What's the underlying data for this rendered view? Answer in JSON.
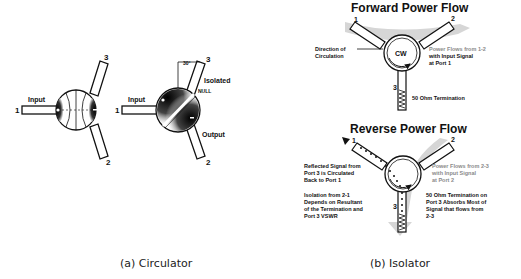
{
  "figure": {
    "panel_a": {
      "caption": "(a) Circulator",
      "left_diagram": {
        "ports": [
          "1",
          "2",
          "3"
        ],
        "input_label": "Input"
      },
      "right_diagram": {
        "ports": [
          "1",
          "2",
          "3"
        ],
        "input_label": "Input",
        "isolated_label": "Isolated",
        "null_label": "NULL",
        "output_label": "Output",
        "angle_label": "30°"
      }
    },
    "panel_b": {
      "caption": "(b) Isolator",
      "forward": {
        "title": "Forward Power Flow",
        "ports": [
          "1",
          "2",
          "3"
        ],
        "center_label": "CW",
        "direction_label_1": "Direction of",
        "direction_label_2": "Circulation",
        "flow_text_1": "Power Flows from 1-2",
        "flow_text_2": "with Input Signal",
        "flow_text_3": "at Port 1",
        "termination_label": "50 Ohm Termination"
      },
      "reverse": {
        "title": "Reverse Power Flow",
        "ports": [
          "1",
          "2",
          "3"
        ],
        "reflected_1": "Reflected Signal from",
        "reflected_2": "Port 3 is Circulated",
        "reflected_3": "Back to Port 1",
        "isolation_1": "Isolation from 2-1",
        "isolation_2": "Depends on Resultant",
        "isolation_3": "of the Termination and",
        "isolation_4": "Port 3 VSWR",
        "flow_text_1": "Power Flows from 2-3",
        "flow_text_2": "with Input Signal",
        "flow_text_3": "at Port 2",
        "term_text_1": "50 Ohm Termination on",
        "term_text_2": "Port 3 Absorbs Most of",
        "term_text_3": "Signal that flows from",
        "term_text_4": "2-3"
      }
    }
  }
}
